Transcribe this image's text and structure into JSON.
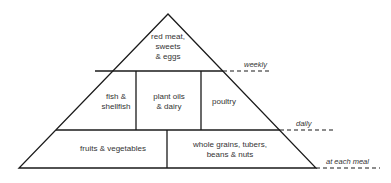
{
  "diagram": {
    "type": "food-pyramid",
    "tiers": [
      {
        "level": "top",
        "sections": [
          {
            "label": "red meat,\nsweets\n& eggs"
          }
        ],
        "frequency": "weekly"
      },
      {
        "level": "middle",
        "sections": [
          {
            "label": "fish &\nshellfish"
          },
          {
            "label": "plant oils\n& dairy"
          },
          {
            "label": "poultry"
          }
        ],
        "frequency": "daily"
      },
      {
        "level": "bottom",
        "sections": [
          {
            "label": "fruits & vegetables"
          },
          {
            "label": "whole grains, tubers,\nbeans & nuts"
          }
        ],
        "frequency": "at each meal"
      }
    ],
    "colors": {
      "line": "#1a1a1a",
      "text": "#333333",
      "background": "#ffffff"
    }
  }
}
